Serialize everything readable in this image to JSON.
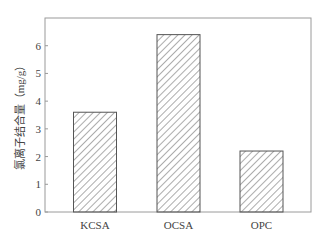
{
  "chart_data": {
    "type": "bar",
    "title": "",
    "xlabel": "",
    "ylabel": "氯离子结合量（mg/g）",
    "categories": [
      "KCSA",
      "OCSA",
      "OPC"
    ],
    "values": [
      3.6,
      6.4,
      2.2
    ],
    "ylim": [
      0,
      7
    ],
    "yticks": [
      0,
      1,
      2,
      3,
      4,
      5,
      6
    ],
    "grid": false,
    "legend": null,
    "bar_fill": "hatched (diagonal lines)",
    "colors": {
      "axis": "#9a9a9a",
      "bar_edge": "#555555",
      "hatch": "#666666",
      "text": "#444444"
    }
  }
}
